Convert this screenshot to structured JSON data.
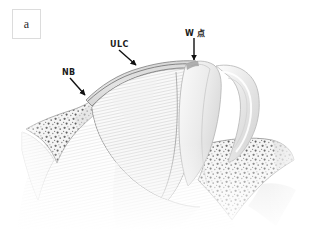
{
  "figure": {
    "panel_letter": "a",
    "type": "anatomical-illustration",
    "color_mode": "grayscale",
    "background": "#ffffff"
  },
  "annotations": [
    {
      "id": "ulc",
      "label": "ULC",
      "description": "upper lateral cartilage",
      "arrow": "down-right",
      "label_x": 110,
      "label_y": 40,
      "tip_x": 137,
      "tip_y": 66
    },
    {
      "id": "nb",
      "label": "NB",
      "description": "nasal bone",
      "arrow": "down-right",
      "label_x": 62,
      "label_y": 68,
      "tip_x": 86,
      "tip_y": 96
    },
    {
      "id": "w-point",
      "label": "W 点",
      "description": "W point",
      "arrow": "down",
      "label_x": 185,
      "label_y": 27,
      "tip_x": 194,
      "tip_y": 61
    }
  ],
  "colors": {
    "cartilage_light": "#e8e8e8",
    "cartilage_mid": "#d4d4d4",
    "cartilage_dark": "#b8b8b8",
    "bone_fill": "#f2f2f2",
    "bone_speckle": "#6f6f6f",
    "outline": "#8a8a8a",
    "outline_dark": "#4a4a4a",
    "label_text": "#1b1b1b",
    "arrow": "#111111",
    "panel_border": "#dcdcdc"
  },
  "structures": [
    {
      "name": "nasal-bone-left",
      "texture": "cancellous-speckle"
    },
    {
      "name": "nasal-bone-right",
      "texture": "cancellous-speckle"
    },
    {
      "name": "upper-lateral-cartilage",
      "texture": "fine-hatch"
    },
    {
      "name": "septal-cartilage-dome",
      "texture": "fine-hatch"
    },
    {
      "name": "w-point-ridge",
      "texture": "smooth"
    },
    {
      "name": "turbinate-loop",
      "texture": "smooth"
    },
    {
      "name": "soft-tissue-base",
      "texture": "fine-hatch"
    }
  ]
}
